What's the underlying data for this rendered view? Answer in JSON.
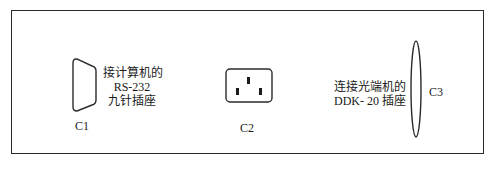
{
  "diagram": {
    "type": "connector-panel",
    "components": [
      {
        "id": "C1",
        "label": "C1",
        "shape": "d-sub-9pin",
        "description_lines": [
          "接计算机的",
          "RS-232",
          "九针插座"
        ]
      },
      {
        "id": "C2",
        "label": "C2",
        "shape": "iec-power-socket",
        "description_lines": []
      },
      {
        "id": "C3",
        "label": "C3",
        "shape": "ellipse-port",
        "description_lines": [
          "连接光端机的",
          "DDK- 20 插座"
        ]
      }
    ]
  },
  "colors": {
    "line": "#2b2b2b",
    "background": "#ffffff",
    "text": "#1a1a1a"
  }
}
